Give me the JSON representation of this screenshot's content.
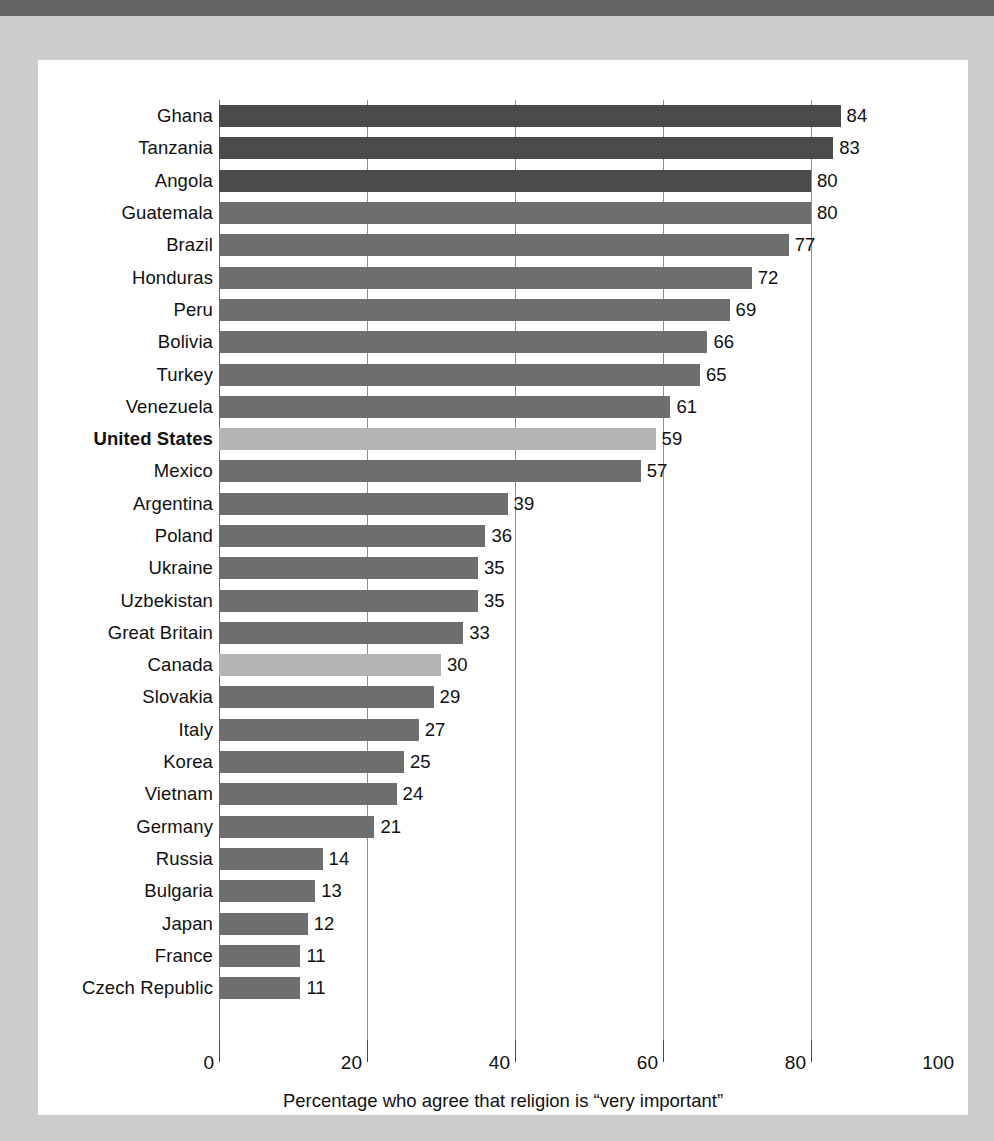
{
  "chart_data": {
    "type": "bar",
    "orientation": "horizontal",
    "title": "",
    "xlabel": "Percentage who agree that religion is “very important”",
    "ylabel": "",
    "xlim": [
      0,
      100
    ],
    "xticks": [
      0,
      20,
      40,
      60,
      80,
      100
    ],
    "xtick_labels": [
      "0",
      "20",
      "40",
      "60",
      "80",
      "100"
    ],
    "grid": true,
    "gridlines_at": [
      0,
      20,
      40,
      60,
      80
    ],
    "legend": null,
    "categories": [
      "Ghana",
      "Tanzania",
      "Angola",
      "Guatemala",
      "Brazil",
      "Honduras",
      "Peru",
      "Bolivia",
      "Turkey",
      "Venezuela",
      "United States",
      "Mexico",
      "Argentina",
      "Poland",
      "Ukraine",
      "Uzbekistan",
      "Great Britain",
      "Canada",
      "Slovakia",
      "Italy",
      "Korea",
      "Vietnam",
      "Germany",
      "Russia",
      "Bulgaria",
      "Japan",
      "France",
      "Czech Republic"
    ],
    "values": [
      84,
      83,
      80,
      80,
      77,
      72,
      69,
      66,
      65,
      61,
      59,
      57,
      39,
      36,
      35,
      35,
      33,
      30,
      29,
      27,
      25,
      24,
      21,
      14,
      13,
      12,
      11,
      11
    ],
    "bars": [
      {
        "label": "Ghana",
        "value": 84,
        "shade": "dark",
        "highlight": false
      },
      {
        "label": "Tanzania",
        "value": 83,
        "shade": "dark",
        "highlight": false
      },
      {
        "label": "Angola",
        "value": 80,
        "shade": "dark",
        "highlight": false
      },
      {
        "label": "Guatemala",
        "value": 80,
        "shade": "mid",
        "highlight": false
      },
      {
        "label": "Brazil",
        "value": 77,
        "shade": "mid",
        "highlight": false
      },
      {
        "label": "Honduras",
        "value": 72,
        "shade": "mid",
        "highlight": false
      },
      {
        "label": "Peru",
        "value": 69,
        "shade": "mid",
        "highlight": false
      },
      {
        "label": "Bolivia",
        "value": 66,
        "shade": "mid",
        "highlight": false
      },
      {
        "label": "Turkey",
        "value": 65,
        "shade": "mid",
        "highlight": false
      },
      {
        "label": "Venezuela",
        "value": 61,
        "shade": "mid",
        "highlight": false
      },
      {
        "label": "United States",
        "value": 59,
        "shade": "light",
        "highlight": true
      },
      {
        "label": "Mexico",
        "value": 57,
        "shade": "mid",
        "highlight": false
      },
      {
        "label": "Argentina",
        "value": 39,
        "shade": "mid",
        "highlight": false
      },
      {
        "label": "Poland",
        "value": 36,
        "shade": "mid",
        "highlight": false
      },
      {
        "label": "Ukraine",
        "value": 35,
        "shade": "mid",
        "highlight": false
      },
      {
        "label": "Uzbekistan",
        "value": 35,
        "shade": "mid",
        "highlight": false
      },
      {
        "label": "Great Britain",
        "value": 33,
        "shade": "mid",
        "highlight": false
      },
      {
        "label": "Canada",
        "value": 30,
        "shade": "light",
        "highlight": false
      },
      {
        "label": "Slovakia",
        "value": 29,
        "shade": "mid",
        "highlight": false
      },
      {
        "label": "Italy",
        "value": 27,
        "shade": "mid",
        "highlight": false
      },
      {
        "label": "Korea",
        "value": 25,
        "shade": "mid",
        "highlight": false
      },
      {
        "label": "Vietnam",
        "value": 24,
        "shade": "mid",
        "highlight": false
      },
      {
        "label": "Germany",
        "value": 21,
        "shade": "mid",
        "highlight": false
      },
      {
        "label": "Russia",
        "value": 14,
        "shade": "mid",
        "highlight": false
      },
      {
        "label": "Bulgaria",
        "value": 13,
        "shade": "mid",
        "highlight": false
      },
      {
        "label": "Japan",
        "value": 12,
        "shade": "mid",
        "highlight": false
      },
      {
        "label": "France",
        "value": 11,
        "shade": "mid",
        "highlight": false
      },
      {
        "label": "Czech Republic",
        "value": 11,
        "shade": "mid",
        "highlight": false
      }
    ],
    "colors": {
      "bar_dark": "#4b4b4b",
      "bar_mid": "#6e6e6e",
      "bar_light": "#b4b4b4",
      "gridline": "#8e8e8e",
      "page_background": "#cdcdcd",
      "card_background": "#ffffff",
      "top_rule": "#636363",
      "text": "#111111"
    }
  },
  "axis": {
    "title": "Percentage who agree that religion is “very important”",
    "ticks": [
      "0",
      "20",
      "40",
      "60",
      "80",
      "100"
    ]
  },
  "footnote": {
    "text": ""
  }
}
